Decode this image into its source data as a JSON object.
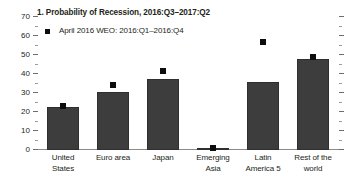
{
  "chart_data": {
    "type": "bar",
    "title": "1. Probability of Recession, 2016:Q3–2017:Q2",
    "xlabel": "",
    "ylabel": "",
    "ylim": [
      0,
      70
    ],
    "ytick_step": 10,
    "yminor_step": 5,
    "grid": false,
    "legend_position": "top-left",
    "categories": [
      "United States",
      "Euro area",
      "Japan",
      "Emerging Asia",
      "Latin America 5",
      "Rest of the world"
    ],
    "category_lines": [
      [
        "United",
        "States"
      ],
      [
        "Euro area"
      ],
      [
        "Japan"
      ],
      [
        "Emerging",
        "Asia"
      ],
      [
        "Latin",
        "America 5"
      ],
      [
        "Rest of the",
        "world"
      ]
    ],
    "ytick_labels": [
      "0",
      "10",
      "20",
      "30",
      "40",
      "50",
      "60",
      "70"
    ],
    "ytick_values": [
      0,
      10,
      20,
      30,
      40,
      50,
      60,
      70
    ],
    "series": [
      {
        "name": "Probability of Recession, 2016:Q3–2017:Q2",
        "type": "bar",
        "values": [
          22.5,
          30.5,
          37.5,
          0.5,
          36,
          48
        ],
        "color": "#3d3d3d"
      },
      {
        "name": "April 2016 WEO: 2016:Q1–2016:Q4",
        "type": "marker",
        "marker": "square",
        "values": [
          23,
          34,
          41.5,
          1,
          57,
          49
        ],
        "color": "#0d0d0d"
      }
    ]
  },
  "legend": {
    "entries": [
      {
        "label": "April 2016 WEO: 2016:Q1–2016:Q4",
        "marker": "square",
        "color": "#0d0d0d"
      }
    ]
  },
  "colors": {
    "bar": "#3d3d3d",
    "bar_edge": "#2f2f2f",
    "marker": "#0d0d0d",
    "axis": "#8a8a8a",
    "text": "#231f20",
    "background": "#ffffff"
  }
}
